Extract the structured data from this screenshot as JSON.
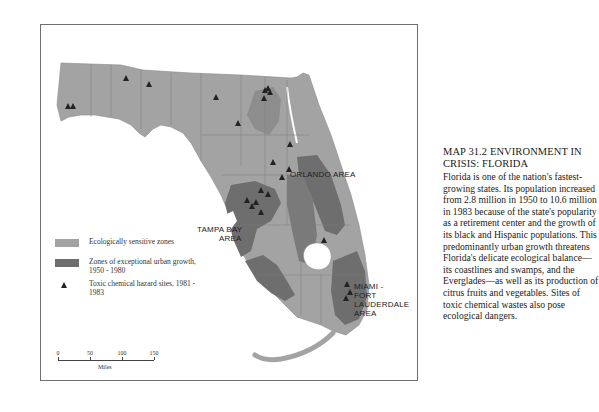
{
  "map": {
    "region": "Florida",
    "labels": {
      "orlando": "ORLANDO AREA",
      "tampa_line1": "TAMPA BAY",
      "tampa_line2": "AREA",
      "miami_line1": "MIAMI -",
      "miami_line2": "FORT",
      "miami_line3": "LAUDERDALE",
      "miami_line4": "AREA"
    },
    "colors": {
      "ecologically_sensitive": "#a3a3a3",
      "urban_growth": "#6e6e6e",
      "hazard_marker": "#222222",
      "water": "#ffffff",
      "frame": "#6f6f6f"
    }
  },
  "legend": {
    "items": [
      {
        "icon": "light-gray-swatch",
        "label": "Ecologically sensitive zones"
      },
      {
        "icon": "dark-gray-swatch",
        "label": "Zones of exceptional urban growth, 1950 - 1980"
      },
      {
        "icon": "triangle-icon",
        "label": "Toxic chemical hazard sites, 1981 - 1983"
      }
    ]
  },
  "scale": {
    "ticks": [
      "0",
      "50",
      "100",
      "150"
    ],
    "unit": "Miles"
  },
  "caption": {
    "title": "MAP 31.2 ENVIRONMENT IN CRISIS: FLORIDA",
    "body": "Florida is one of the nation's fastest-growing states. Its population increased from 2.8 million in 1950 to 10.6 million in 1983 because of the state's popularity as a retirement center and the growth of its black and Hispanic populations. This predominantly urban growth threatens Florida's delicate ecological balance—its coastlines and swamps, and the Everglades—as well as its production of citrus fruits and vegetables. Sites of toxic chemical wastes also pose ecological dangers."
  }
}
